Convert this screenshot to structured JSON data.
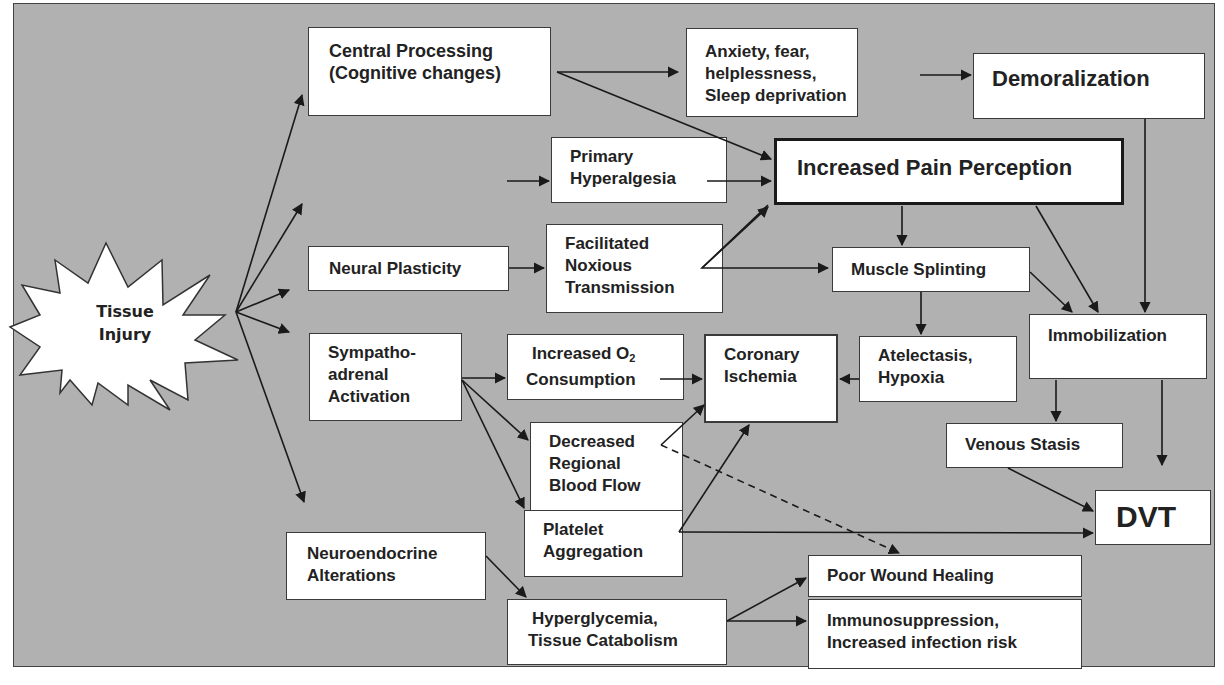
{
  "diagram": {
    "type": "flowchart",
    "background_color": "#b1b1b1",
    "box_color": "#ffffff",
    "start_node": {
      "id": "tissue_injury",
      "lines": [
        "Tissue",
        "Injury"
      ],
      "shape": "starburst"
    },
    "nodes": {
      "central_processing": {
        "lines": [
          "Central Processing",
          "(Cognitive changes)"
        ]
      },
      "anxiety": {
        "lines": [
          "Anxiety, fear,",
          "helplessness,",
          "Sleep deprivation"
        ]
      },
      "demoralization": {
        "lines": [
          "Demoralization"
        ]
      },
      "primary_hyperalgesia": {
        "lines": [
          "Primary",
          "Hyperalgesia"
        ]
      },
      "increased_pain_perception": {
        "lines": [
          "Increased Pain Perception"
        ],
        "emphasis": "thick-border"
      },
      "neural_plasticity": {
        "lines": [
          "Neural Plasticity"
        ]
      },
      "facilitated_noxious": {
        "lines": [
          "Facilitated",
          "Noxious",
          "Transmission"
        ]
      },
      "muscle_splinting": {
        "lines": [
          "Muscle Splinting"
        ]
      },
      "immobilization": {
        "lines": [
          "Immobilization"
        ]
      },
      "sympathoadrenal": {
        "lines": [
          "Sympatho-",
          "adrenal",
          "Activation"
        ]
      },
      "increased_o2": {
        "lines": [
          "Increased O",
          "Consumption"
        ],
        "subscript": "2"
      },
      "coronary_ischemia": {
        "lines": [
          "Coronary",
          "Ischemia"
        ]
      },
      "atelectasis": {
        "lines": [
          "Atelectasis,",
          "Hypoxia"
        ]
      },
      "decreased_blood_flow": {
        "lines": [
          "Decreased",
          "Regional",
          "Blood Flow"
        ]
      },
      "venous_stasis": {
        "lines": [
          "Venous Stasis"
        ]
      },
      "platelet_aggregation": {
        "lines": [
          "Platelet",
          "Aggregation"
        ]
      },
      "dvt": {
        "lines": [
          "DVT"
        ]
      },
      "neuroendocrine": {
        "lines": [
          "Neuroendocrine",
          "Alterations"
        ]
      },
      "poor_wound_healing": {
        "lines": [
          "Poor Wound Healing"
        ]
      },
      "hyperglycemia": {
        "lines": [
          "Hyperglycemia,",
          "Tissue Catabolism"
        ]
      },
      "immunosuppression": {
        "lines": [
          "Immunosuppression,",
          "Increased infection risk"
        ]
      }
    },
    "edges": [
      {
        "from": "tissue_injury",
        "to": "central_processing"
      },
      {
        "from": "tissue_injury",
        "to": "primary_hyperalgesia"
      },
      {
        "from": "tissue_injury",
        "to": "neural_plasticity"
      },
      {
        "from": "tissue_injury",
        "to": "sympathoadrenal"
      },
      {
        "from": "tissue_injury",
        "to": "neuroendocrine"
      },
      {
        "from": "central_processing",
        "to": "anxiety"
      },
      {
        "from": "central_processing",
        "to": "increased_pain_perception"
      },
      {
        "from": "anxiety",
        "to": "demoralization"
      },
      {
        "from": "demoralization",
        "to": "immobilization"
      },
      {
        "from": "primary_hyperalgesia",
        "to": "increased_pain_perception"
      },
      {
        "from": "neural_plasticity",
        "to": "facilitated_noxious"
      },
      {
        "from": "facilitated_noxious",
        "to": "increased_pain_perception"
      },
      {
        "from": "facilitated_noxious",
        "to": "muscle_splinting"
      },
      {
        "from": "increased_pain_perception",
        "to": "muscle_splinting"
      },
      {
        "from": "increased_pain_perception",
        "to": "immobilization"
      },
      {
        "from": "muscle_splinting",
        "to": "immobilization"
      },
      {
        "from": "muscle_splinting",
        "to": "atelectasis"
      },
      {
        "from": "atelectasis",
        "to": "coronary_ischemia"
      },
      {
        "from": "sympathoadrenal",
        "to": "increased_o2"
      },
      {
        "from": "sympathoadrenal",
        "to": "decreased_blood_flow"
      },
      {
        "from": "sympathoadrenal",
        "to": "platelet_aggregation"
      },
      {
        "from": "increased_o2",
        "to": "coronary_ischemia"
      },
      {
        "from": "decreased_blood_flow",
        "to": "coronary_ischemia"
      },
      {
        "from": "decreased_blood_flow",
        "to": "poor_wound_healing",
        "style": "dashed"
      },
      {
        "from": "platelet_aggregation",
        "to": "coronary_ischemia"
      },
      {
        "from": "platelet_aggregation",
        "to": "dvt"
      },
      {
        "from": "immobilization",
        "to": "venous_stasis"
      },
      {
        "from": "immobilization",
        "to": "dvt"
      },
      {
        "from": "venous_stasis",
        "to": "dvt"
      },
      {
        "from": "neuroendocrine",
        "to": "hyperglycemia"
      },
      {
        "from": "hyperglycemia",
        "to": "poor_wound_healing"
      },
      {
        "from": "hyperglycemia",
        "to": "immunosuppression"
      }
    ]
  }
}
